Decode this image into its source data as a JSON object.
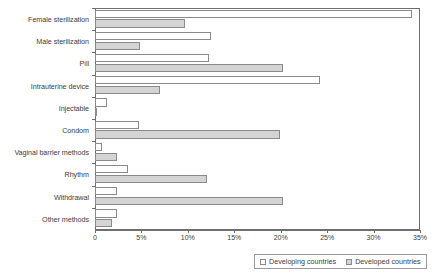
{
  "chart_data": {
    "type": "bar",
    "orientation": "horizontal",
    "title": "",
    "xlabel": "",
    "ylabel": "",
    "xlim": [
      0,
      35
    ],
    "grid": false,
    "legend_position": "bottom-right",
    "categories": [
      "Female sterilization",
      "Male sterilization",
      "Pill",
      "Intrauterine device",
      "Injectable",
      "Condom",
      "Vaginal barrier methods",
      "Rhythm",
      "Withdrawal",
      "Other methods"
    ],
    "series": [
      {
        "name": "Developing countries",
        "color": "#ffffff",
        "values": [
          34.1,
          12.5,
          12.3,
          24.2,
          1.3,
          4.7,
          0.8,
          3.6,
          2.4,
          2.4
        ]
      },
      {
        "name": "Developed countries",
        "color": "#d4d4d4",
        "values": [
          9.7,
          4.8,
          20.2,
          7.0,
          0.2,
          19.9,
          2.4,
          12.1,
          20.2,
          1.8
        ]
      }
    ],
    "xticks": [
      {
        "value": 0,
        "label": "0"
      },
      {
        "value": 5,
        "label": "5%"
      },
      {
        "value": 10,
        "label": "10%"
      },
      {
        "value": 15,
        "label": "15%"
      },
      {
        "value": 20,
        "label": "20%"
      },
      {
        "value": 25,
        "label": "25%"
      },
      {
        "value": 30,
        "label": "30%"
      },
      {
        "value": 35,
        "label": "35%"
      }
    ]
  },
  "legend": {
    "entries": [
      {
        "label": "Developing countries",
        "swatch": "#ffffff"
      },
      {
        "label": "Developed countries",
        "swatch": "#d4d4d4"
      }
    ]
  }
}
